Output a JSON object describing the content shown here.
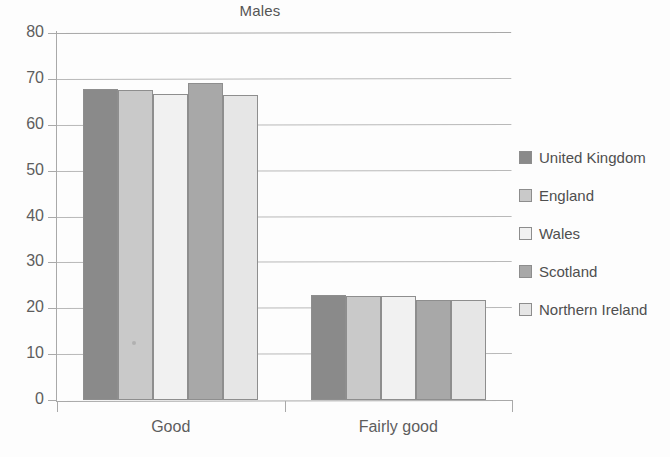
{
  "chart_data": {
    "type": "bar",
    "title": "Males",
    "xlabel": "",
    "ylabel": "",
    "categories": [
      "Good",
      "Fairly good"
    ],
    "series": [
      {
        "name": "United Kingdom",
        "color": "#8a8a8a",
        "values": [
          67.8,
          22.8
        ]
      },
      {
        "name": "England",
        "color": "#c9c9c9",
        "values": [
          67.5,
          22.7
        ]
      },
      {
        "name": "Wales",
        "color": "#f1f1f1",
        "values": [
          66.7,
          22.6
        ]
      },
      {
        "name": "Scotland",
        "color": "#a8a8a8",
        "values": [
          69.0,
          21.8
        ]
      },
      {
        "name": "Northern Ireland",
        "color": "#e6e6e6",
        "values": [
          66.5,
          21.7
        ]
      }
    ],
    "ylim": [
      0,
      80
    ],
    "ytick_labels": [
      "80",
      "70",
      "60",
      "50",
      "40",
      "30",
      "20",
      "10",
      "0"
    ],
    "ytick_values": [
      80,
      70,
      60,
      50,
      40,
      30,
      20,
      10,
      0
    ],
    "grid": true,
    "legend_position": "right"
  },
  "legend": {
    "entries": [
      {
        "label": "United Kingdom"
      },
      {
        "label": "England"
      },
      {
        "label": "Wales"
      },
      {
        "label": "Scotland"
      },
      {
        "label": "Northern Ireland"
      }
    ]
  }
}
